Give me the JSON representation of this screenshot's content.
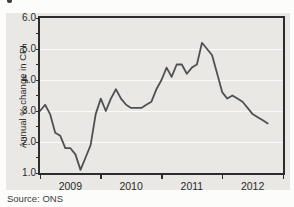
{
  "page": {
    "source_note": "Source: ONS"
  },
  "chart_data": {
    "type": "line",
    "title": "",
    "xlabel": "",
    "ylabel": "Annual % change in CPI",
    "x_domain": [
      2009,
      2013
    ],
    "ylim": [
      1.0,
      6.0
    ],
    "y_major_ticks": [
      1.0,
      2.0,
      3.0,
      4.0,
      5.0,
      6.0
    ],
    "y_minor_tick_step": 0.5,
    "x_tick_years": [
      2009,
      2010,
      2011,
      2012,
      2013
    ],
    "x_tick_labels": [
      "2009",
      "2010",
      "2011",
      "2012"
    ],
    "grid": "horizontal white gridlines at whole-number values",
    "legend": "none",
    "series": [
      {
        "name": "Annual % change in CPI",
        "frequency": "monthly",
        "start": "2009-01",
        "end": "2012-10",
        "values": [
          3.0,
          3.2,
          2.9,
          2.3,
          2.2,
          1.8,
          1.8,
          1.6,
          1.1,
          1.5,
          1.9,
          2.9,
          3.4,
          3.0,
          3.4,
          3.7,
          3.4,
          3.2,
          3.1,
          3.1,
          3.1,
          3.2,
          3.3,
          3.7,
          4.0,
          4.4,
          4.1,
          4.5,
          4.5,
          4.2,
          4.4,
          4.5,
          5.2,
          5.0,
          4.8,
          4.2,
          3.6,
          3.4,
          3.5,
          3.4,
          3.3,
          3.1,
          2.9,
          2.8,
          2.7,
          2.6
        ]
      }
    ],
    "colors": {
      "line": "#4f5052",
      "panel_background": "#e9e8e5",
      "gridline": "#fbfbf9",
      "frame": "#2d2d2d",
      "tick": "#2d2d2d",
      "text": "#2a2a2a",
      "page_background": "#fcfcfa"
    }
  }
}
